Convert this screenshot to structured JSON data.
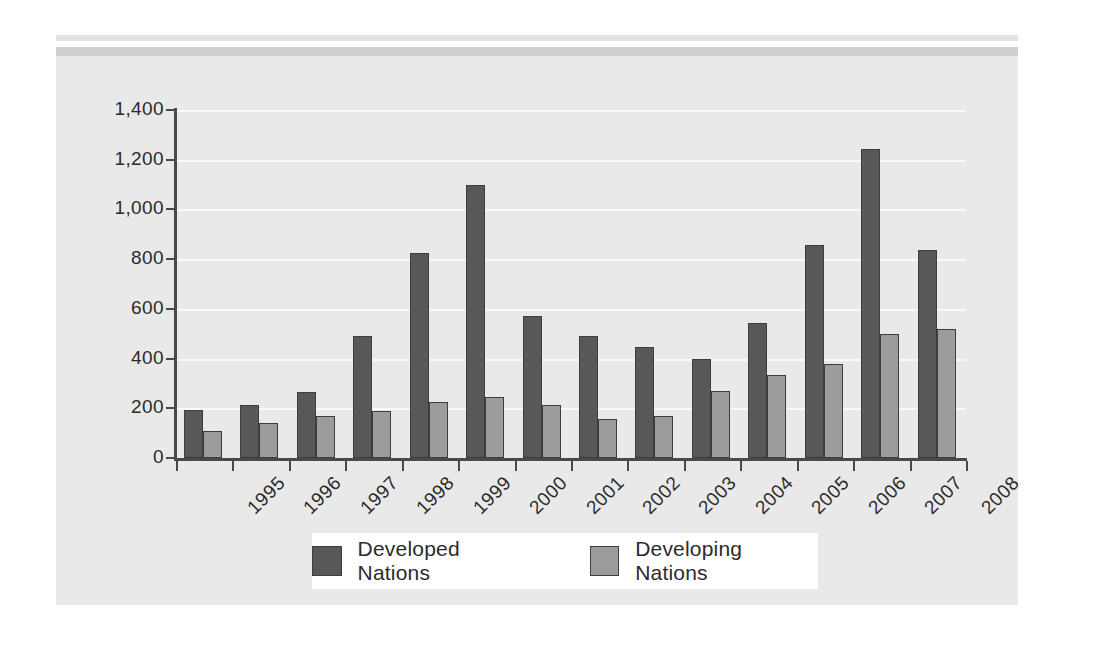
{
  "chart_data": {
    "type": "bar",
    "title": "",
    "subtitle": "",
    "xlabel": "",
    "ylabel": "",
    "categories": [
      "1995",
      "1996",
      "1997",
      "1998",
      "1999",
      "2000",
      "2001",
      "2002",
      "2003",
      "2004",
      "2005",
      "2006",
      "2007",
      "2008"
    ],
    "series": [
      {
        "name": "Developed Nations",
        "color": "#585858",
        "values": [
          195,
          215,
          265,
          490,
          825,
          1100,
          570,
          490,
          445,
          400,
          545,
          855,
          1245,
          835
        ]
      },
      {
        "name": "Developing Nations",
        "color": "#9c9c9c",
        "values": [
          110,
          140,
          170,
          190,
          225,
          245,
          215,
          155,
          170,
          270,
          335,
          380,
          500,
          520
        ]
      }
    ],
    "ylim": [
      0,
      1400
    ],
    "ytick_values": [
      0,
      200,
      400,
      600,
      800,
      1000,
      1200,
      1400
    ],
    "ytick_labels": [
      "0",
      "200",
      "400",
      "600",
      "800",
      "1,000",
      "1,200",
      "1,400"
    ],
    "grid": true,
    "grid_color": "#fafafa",
    "legend_position": "bottom",
    "legend": [
      "Developed Nations",
      "Developing Nations"
    ],
    "xtick_rotation": -45,
    "plot_background": "#e9e9e9",
    "axis_color": "#4a4a4a"
  },
  "legend": {
    "items": [
      {
        "label": "Developed Nations"
      },
      {
        "label": "Developing Nations"
      }
    ]
  }
}
